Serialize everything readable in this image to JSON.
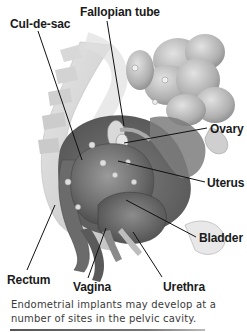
{
  "figure": {
    "labels": {
      "cul_de_sac": "Cul-de-sac",
      "fallopian_tube": "Fallopian tube",
      "ovary": "Ovary",
      "uterus": "Uterus",
      "bladder": "Bladder",
      "rectum": "Rectum",
      "vagina": "Vagina",
      "urethra": "Urethra"
    },
    "caption": "Endometrial implants may develop at a number of sites in the pelvic cavity."
  },
  "colors": {
    "background": "#ffffff",
    "label_text": "#1a1a1a",
    "leader_line": "#111111",
    "caption_text": "#3a3a3a",
    "tissue_dark": "#5e5e5e",
    "tissue_mid": "#8a8a8a",
    "tissue_light": "#c8c8c8"
  }
}
